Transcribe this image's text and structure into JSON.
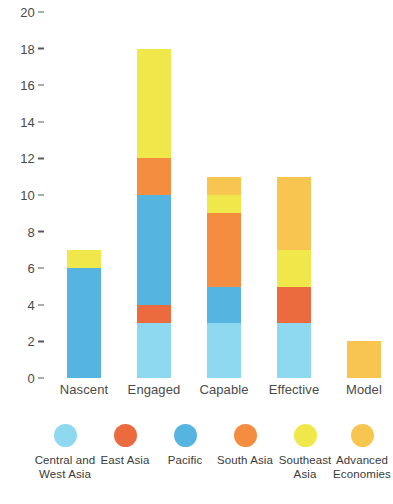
{
  "chart_data": {
    "type": "bar",
    "title": "",
    "subtitle": "",
    "xlabel": "",
    "ylabel": "",
    "stacked": true,
    "grid": false,
    "legend_position": "bottom",
    "ylim": [
      0,
      20
    ],
    "yticks": [
      0,
      2,
      4,
      6,
      8,
      10,
      12,
      14,
      16,
      18,
      20
    ],
    "ytick_labels": [
      "0",
      "2",
      "4",
      "6",
      "8",
      "10",
      "12",
      "14",
      "16",
      "18",
      "20"
    ],
    "categories": [
      "Nascent",
      "Engaged",
      "Capable",
      "Effective",
      "Model"
    ],
    "series": [
      {
        "name": "Central and West Asia",
        "color": "#8ed8f0",
        "values": [
          0,
          3,
          3,
          3,
          0
        ]
      },
      {
        "name": "East Asia",
        "color": "#ec6b3e",
        "values": [
          0,
          1,
          0,
          2,
          0
        ]
      },
      {
        "name": "Pacific",
        "color": "#56b4e0",
        "values": [
          6,
          6,
          2,
          0,
          0
        ]
      },
      {
        "name": "South Asia",
        "color": "#f58d40",
        "values": [
          0,
          2,
          4,
          0,
          0
        ]
      },
      {
        "name": "Southeast Asia",
        "color": "#f0e84a",
        "values": [
          1,
          6,
          1,
          2,
          0
        ]
      },
      {
        "name": "Advanced Economies",
        "color": "#f9c551",
        "values": [
          0,
          0,
          1,
          4,
          2
        ]
      }
    ],
    "totals": [
      7,
      18,
      11,
      11,
      2
    ]
  }
}
